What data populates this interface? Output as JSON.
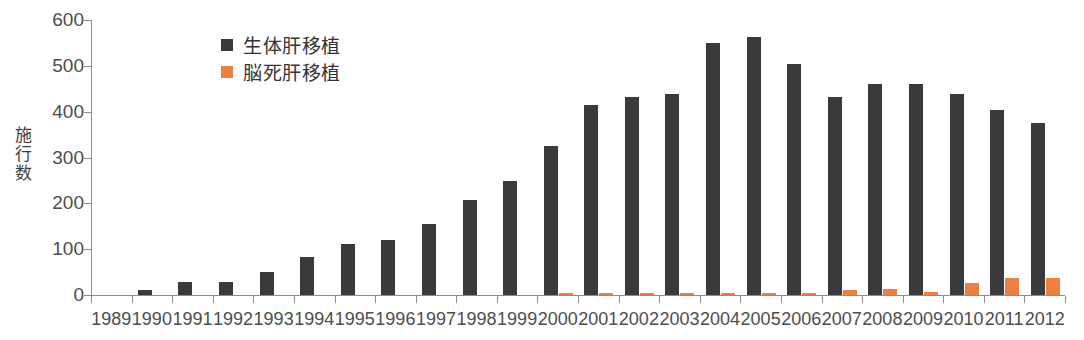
{
  "chart_data": {
    "type": "bar",
    "title": "",
    "xlabel": "",
    "ylabel": "施行数",
    "ylim": [
      0,
      600
    ],
    "yticks": [
      0,
      100,
      200,
      300,
      400,
      500,
      600
    ],
    "grid": false,
    "legend_position": "top-left-inside",
    "categories": [
      "1989",
      "1990",
      "1991",
      "1992",
      "1993",
      "1994",
      "1995",
      "1996",
      "1997",
      "1998",
      "1999",
      "2000",
      "2001",
      "2002",
      "2003",
      "2004",
      "2005",
      "2006",
      "2007",
      "2008",
      "2009",
      "2010",
      "2011",
      "2012"
    ],
    "series": [
      {
        "name": "生体肝移植",
        "color": "#3a3a3c",
        "values": [
          0,
          10,
          29,
          29,
          51,
          82,
          111,
          120,
          156,
          208,
          249,
          325,
          415,
          431,
          438,
          549,
          563,
          503,
          431,
          460,
          461,
          439,
          403,
          376
        ]
      },
      {
        "name": "脳死肝移植",
        "color": "#ef8041",
        "values": [
          0,
          0,
          0,
          0,
          0,
          0,
          0,
          0,
          0,
          0,
          0,
          4,
          4,
          5,
          3,
          3,
          3,
          5,
          10,
          13,
          7,
          27,
          38,
          38
        ]
      }
    ]
  },
  "legend": {
    "items": [
      {
        "label": "生体肝移植",
        "swatch": "primary"
      },
      {
        "label": "脳死肝移植",
        "swatch": "secondary"
      }
    ]
  },
  "axis": {
    "y_title_chars": "施\n行\n数"
  }
}
